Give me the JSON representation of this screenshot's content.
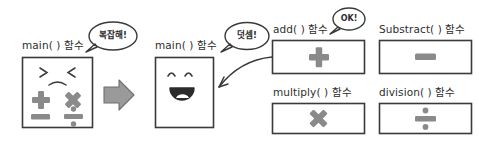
{
  "diagram": {
    "background_color": "#ffffff",
    "ink_color": "#2e2e2e",
    "symbol_color": "#8a8a8a",
    "arrow_color": "#8f8f8f"
  },
  "panels": {
    "before": {
      "label": "main( ) 함수",
      "bubble": "복잡해!",
      "face": "sad",
      "face_eyes": "> <",
      "face_mouth": "frown",
      "symbols": [
        {
          "name": "plus-symbol",
          "glyph": "+"
        },
        {
          "name": "multiply-symbol",
          "glyph": "×"
        },
        {
          "name": "minus-symbol",
          "glyph": "−"
        },
        {
          "name": "divide-symbol",
          "glyph": "÷"
        }
      ]
    },
    "transition": {
      "arrow": "right-arrow"
    },
    "after": {
      "label": "main( ) 함수",
      "bubble": "덧셈!",
      "face": "happy",
      "face_eyes": "∩ ∩",
      "face_mouth": "open-smile"
    }
  },
  "functions": [
    {
      "id": "add",
      "label": "add( ) 함수",
      "symbol": "+",
      "symbol_name": "plus-symbol",
      "bubble": "OK!",
      "has_bubble": true,
      "has_callout": true
    },
    {
      "id": "substract",
      "label": "Substract( ) 함수",
      "symbol": "−",
      "symbol_name": "minus-symbol",
      "bubble": "",
      "has_bubble": false,
      "has_callout": false
    },
    {
      "id": "multiply",
      "label": "multiply( ) 함수",
      "symbol": "×",
      "symbol_name": "multiply-symbol",
      "bubble": "",
      "has_bubble": false,
      "has_callout": false
    },
    {
      "id": "division",
      "label": "division( ) 함수",
      "symbol": "÷",
      "symbol_name": "divide-symbol",
      "bubble": "",
      "has_bubble": false,
      "has_callout": false
    }
  ]
}
